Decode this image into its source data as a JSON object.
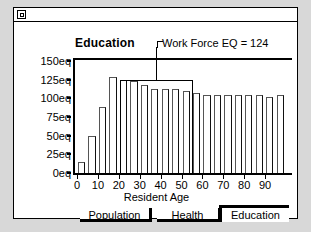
{
  "window": {
    "close_box": "close-box",
    "title": ""
  },
  "chart": {
    "title": "Education",
    "annotation": "Work Force EQ = 124",
    "xlabel": "Resident Age"
  },
  "tabs": [
    {
      "label": "Population",
      "active": false
    },
    {
      "label": "Health",
      "active": false
    },
    {
      "label": "Education",
      "active": true
    }
  ],
  "chart_data": {
    "type": "bar",
    "title": "Education",
    "xlabel": "Resident Age",
    "ylabel": "",
    "ylim": [
      0,
      150
    ],
    "xlim": [
      0,
      100
    ],
    "grid": false,
    "legend": null,
    "ytick_labels": [
      "150eq",
      "125eq",
      "100eq",
      "75eq",
      "50eq",
      "25eq",
      "0eq"
    ],
    "ytick_values": [
      150,
      125,
      100,
      75,
      50,
      25,
      0
    ],
    "xtick_labels": [
      "0",
      "10",
      "20",
      "30",
      "40",
      "50",
      "60",
      "70",
      "80",
      "90"
    ],
    "xtick_values": [
      0,
      10,
      20,
      30,
      40,
      50,
      60,
      70,
      80,
      90
    ],
    "bin_width": 5,
    "categories": [
      "0",
      "5",
      "10",
      "15",
      "20",
      "25",
      "30",
      "35",
      "40",
      "45",
      "50",
      "55",
      "60",
      "65",
      "70",
      "75",
      "80",
      "85",
      "90",
      "95"
    ],
    "values": [
      15,
      50,
      88,
      128,
      125,
      123,
      118,
      112,
      112,
      112,
      110,
      107,
      105,
      105,
      105,
      105,
      105,
      105,
      102,
      105
    ],
    "annotations": [
      {
        "text": "Work Force EQ = 124",
        "type": "bracket",
        "x_start": 20,
        "x_end": 55,
        "value": 124
      }
    ]
  }
}
